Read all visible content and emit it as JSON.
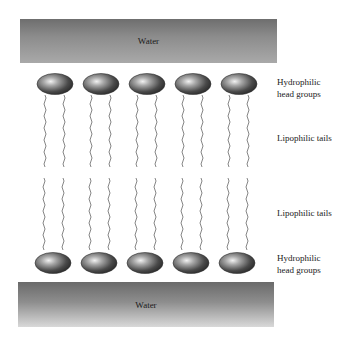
{
  "diagram": {
    "type": "lipid-bilayer",
    "water_top": {
      "label": "Water"
    },
    "water_bottom": {
      "label": "Water"
    },
    "labels": {
      "top_heads_line1": "Hydrophilic",
      "top_heads_line2": "head groups",
      "top_tails": "Lipophilic tails",
      "bottom_tails": "Lipophilic tails",
      "bottom_heads_line1": "Hydrophilic",
      "bottom_heads_line2": "head groups"
    },
    "molecules_per_layer": 5,
    "colors": {
      "head_dark": "#3a3a3a",
      "head_highlight": "#e8e8e8",
      "tail": "#777777",
      "water_dark": "#6e6e6e",
      "water_light": "#c8c8c8"
    }
  }
}
